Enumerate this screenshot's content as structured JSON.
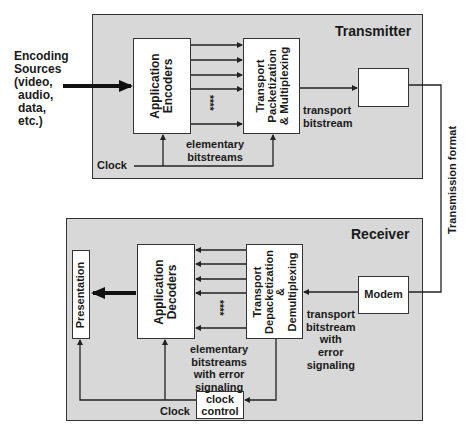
{
  "diagram": {
    "sources_label": [
      "Encoding",
      "Sources",
      "(video,",
      " audio,",
      " data,",
      " etc.)"
    ],
    "transmitter": {
      "title": "Transmitter",
      "encoders_label": [
        "Application",
        "Encoders"
      ],
      "packetization_label": [
        "Transport",
        "Packetization",
        "& Multiplexing"
      ],
      "elementary_label": [
        "elementary",
        "bitstreams"
      ],
      "transport_label": [
        "transport",
        "bitstream"
      ],
      "clock_label": "Clock",
      "dots": "****"
    },
    "link": {
      "label": "Transmission format"
    },
    "receiver": {
      "title": "Receiver",
      "presentation_label": "Presentation",
      "decoders_label": [
        "Application",
        "Decoders"
      ],
      "depacketization_label": [
        "Transport",
        "Depacketization",
        "&",
        "Demultiplexing"
      ],
      "modem_label": "Modem",
      "elementary_label": [
        "elementary",
        "bitstreams",
        "with error",
        "signaling"
      ],
      "transport_label": [
        "transport",
        "bitstream",
        "with",
        "error",
        "signaling"
      ],
      "clock_label": "Clock",
      "clock_control_label": [
        "clock",
        "control"
      ],
      "dots": "****"
    },
    "colors": {
      "panel_bg": "#d8d8d8",
      "box_bg": "#ffffff",
      "line": "#333333",
      "text": "#1a1a1a"
    }
  }
}
